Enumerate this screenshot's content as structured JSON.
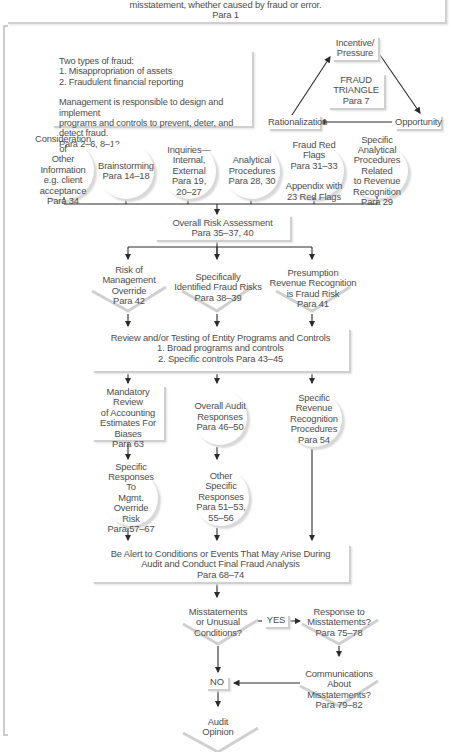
{
  "header": {
    "line1": "misstatement, whether caused by fraud or error.",
    "line2": "Para 1"
  },
  "info_box": {
    "line1": "Two types of fraud:",
    "line2": "1. Misappropriation of assets",
    "line3": "2. Fraudulent financial reporting",
    "line4": "Management is responsible to design and implement",
    "line5": "programs and controls to prevent, deter, and detect fraud.",
    "line6": "Para 2–6, 8–12"
  },
  "fraud_triangle": {
    "top": [
      "Incentive/",
      "Pressure"
    ],
    "center": [
      "FRAUD",
      "TRIANGLE",
      "Para 7"
    ],
    "left": "Rationalization",
    "right": "Opportunity"
  },
  "inputs": [
    {
      "lines": [
        "Consideration of",
        "Other Information",
        "e.g. client",
        "acceptance",
        "Para 34"
      ]
    },
    {
      "lines": [
        "Brainstorming",
        "Para 14–18"
      ]
    },
    {
      "lines": [
        "Inquiries—",
        "Internal,",
        "External",
        "Para 19,",
        "20–27"
      ]
    },
    {
      "lines": [
        "Analytical",
        "Procedures",
        "Para 28, 30"
      ]
    },
    {
      "lines": [
        "Fraud Red Flags",
        "Para 31–33",
        "",
        "Appendix with",
        "23 Red Flags"
      ]
    },
    {
      "lines": [
        "Specific Analytical",
        "Procedures Related",
        "to Revenue",
        "Recognition",
        "Para 29"
      ]
    }
  ],
  "risk_assessment": {
    "line1": "Overall Risk Assessment",
    "line2": "Para 35–37, 40"
  },
  "risks": [
    {
      "lines": [
        "Risk of",
        "Management",
        "Override",
        "Para 42"
      ]
    },
    {
      "lines": [
        "Specifically",
        "Identified Fraud Risks",
        "Para 38–39"
      ]
    },
    {
      "lines": [
        "Presumption",
        "Revenue Recognition",
        "is Fraud Risk",
        "Para 41"
      ]
    }
  ],
  "review_box": {
    "line1": "Review and/or Testing of Entity Programs and Controls",
    "line2": "1.  Broad programs and controls",
    "line3": "2.  Specific controls   Para 43–45"
  },
  "mandatory_review": {
    "lines": [
      "Mandatory Review",
      "of Accounting",
      "Estimates For",
      "Biases",
      "Para 63"
    ]
  },
  "overall_responses": {
    "lines": [
      "Overall Audit",
      "Responses",
      "Para 46–50"
    ]
  },
  "revenue_procedures": {
    "lines": [
      "Specific Revenue",
      "Recognition",
      "Procedures",
      "Para 54"
    ]
  },
  "mgmt_override_responses": {
    "lines": [
      "Specific",
      "Responses To",
      "Mgmt. Override",
      "Risk",
      "Para 57–67"
    ]
  },
  "other_responses": {
    "lines": [
      "Other Specific",
      "Responses",
      "Para 51–53,",
      "55–56"
    ]
  },
  "alert_box": {
    "line1": "Be Alert to Conditions or Events That May Arise During",
    "line2": "Audit and Conduct Final Fraud Analysis",
    "line3": "Para 68–74"
  },
  "decision": {
    "lines": [
      "Misstatements",
      "or Unusual",
      "Conditions?"
    ]
  },
  "yes_label": "YES",
  "response_misstatements": {
    "lines": [
      "Response to",
      "Misstatements?",
      "Para 75–78"
    ]
  },
  "communications": {
    "lines": [
      "Communications",
      "About Misstatements?",
      "Para 79–82"
    ]
  },
  "no_label": "NO",
  "audit_opinion": {
    "lines": [
      "Audit",
      "Opinion"
    ]
  },
  "colors": {
    "line": "#2b2b2b",
    "shadow": "#cfcfcf",
    "text": "#4d4d4d",
    "border": "#d0d0d0"
  }
}
